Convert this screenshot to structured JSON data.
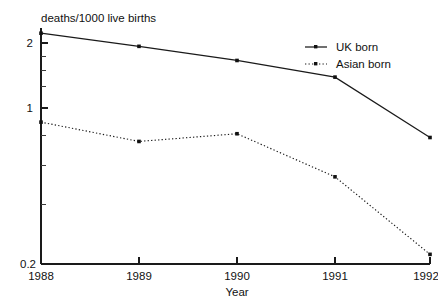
{
  "chart_data": {
    "type": "line",
    "title": "deaths/1000 live births",
    "xlabel": "Year",
    "ylabel": "",
    "yscale": "log",
    "ylim": [
      0.2,
      2.4
    ],
    "grid": false,
    "legend_position": "top-right",
    "categories": [
      "1988",
      "1989",
      "1990",
      "1991",
      "1992"
    ],
    "x": [
      1988,
      1989,
      1990,
      1991,
      1992
    ],
    "xtick_labels": [
      "1988",
      "1989",
      "1990",
      "1991",
      "1992"
    ],
    "ytick_labels": [
      "2",
      "1",
      "0.2"
    ],
    "ytick_values": [
      2,
      1,
      0.2
    ],
    "series": [
      {
        "name": "UK born",
        "style": "solid",
        "marker": "square",
        "values": [
          2.22,
          1.93,
          1.66,
          1.39,
          0.73
        ]
      },
      {
        "name": "Asian born",
        "style": "dotted",
        "marker": "square",
        "values": [
          0.86,
          0.7,
          0.76,
          0.48,
          0.21
        ]
      }
    ]
  },
  "legend": {
    "entries": [
      {
        "label": "UK born"
      },
      {
        "label": "Asian born"
      }
    ]
  },
  "colors": {
    "line": "#1a1a1a",
    "text": "#111111",
    "background": "#ffffff"
  }
}
